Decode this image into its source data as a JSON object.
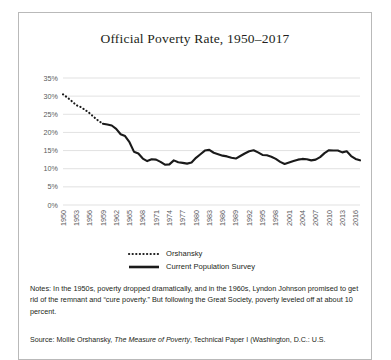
{
  "figure": {
    "title": "Official Poverty Rate, 1950–2017",
    "source_prefix": "Source: Mollie Orshansky, ",
    "source_italic": "The Measure of Poverty",
    "source_suffix": ", Technical Paper I (Washington, D.C.: U.S."
  },
  "legend": {
    "position": "bottom",
    "entries": [
      {
        "label": "Orshansky",
        "style": "dotted",
        "color": "#1a1a1a"
      },
      {
        "label": "Current Population Survey",
        "style": "solid",
        "color": "#1a1a1a"
      }
    ]
  },
  "chart_data": {
    "type": "line",
    "title": "Official Poverty Rate, 1950–2017",
    "xlabel": "",
    "ylabel": "",
    "xlim": [
      1950,
      2017
    ],
    "ylim": [
      0,
      35
    ],
    "ytick_step": 5,
    "ytick_labels": [
      "0%",
      "5%",
      "10%",
      "15%",
      "20%",
      "25%",
      "30%",
      "35%"
    ],
    "xtick_labels": [
      "1950",
      "1953",
      "1956",
      "1959",
      "1962",
      "1965",
      "1968",
      "1971",
      "1974",
      "1977",
      "1980",
      "1983",
      "1986",
      "1989",
      "1992",
      "1995",
      "1998",
      "2001",
      "2004",
      "2007",
      "2010",
      "2013",
      "2016"
    ],
    "xtick_step": 3,
    "grid": true,
    "series": [
      {
        "name": "Orshansky",
        "style": "dotted",
        "color": "#1a1a1a",
        "x": [
          1950,
          1951,
          1952,
          1953,
          1954,
          1955,
          1956,
          1957,
          1958,
          1959
        ],
        "values": [
          30.5,
          29.6,
          28.6,
          27.5,
          27.0,
          26.2,
          25.3,
          24.2,
          23.2,
          22.4
        ]
      },
      {
        "name": "Current Population Survey",
        "style": "solid",
        "color": "#1a1a1a",
        "x": [
          1959,
          1960,
          1961,
          1962,
          1963,
          1964,
          1965,
          1966,
          1967,
          1968,
          1969,
          1970,
          1971,
          1972,
          1973,
          1974,
          1975,
          1976,
          1977,
          1978,
          1979,
          1980,
          1981,
          1982,
          1983,
          1984,
          1985,
          1986,
          1987,
          1988,
          1989,
          1990,
          1991,
          1992,
          1993,
          1994,
          1995,
          1996,
          1997,
          1998,
          1999,
          2000,
          2001,
          2002,
          2003,
          2004,
          2005,
          2006,
          2007,
          2008,
          2009,
          2010,
          2011,
          2012,
          2013,
          2014,
          2015,
          2016,
          2017
        ],
        "values": [
          22.4,
          22.2,
          21.9,
          21.0,
          19.5,
          19.0,
          17.3,
          14.7,
          14.2,
          12.8,
          12.1,
          12.6,
          12.5,
          11.9,
          11.1,
          11.2,
          12.3,
          11.8,
          11.6,
          11.4,
          11.7,
          13.0,
          14.0,
          15.0,
          15.2,
          14.4,
          14.0,
          13.6,
          13.4,
          13.0,
          12.8,
          13.5,
          14.2,
          14.8,
          15.1,
          14.5,
          13.8,
          13.7,
          13.3,
          12.7,
          11.9,
          11.3,
          11.7,
          12.1,
          12.5,
          12.7,
          12.6,
          12.3,
          12.5,
          13.2,
          14.3,
          15.1,
          15.0,
          15.0,
          14.5,
          14.8,
          13.5,
          12.7,
          12.3
        ]
      }
    ]
  }
}
